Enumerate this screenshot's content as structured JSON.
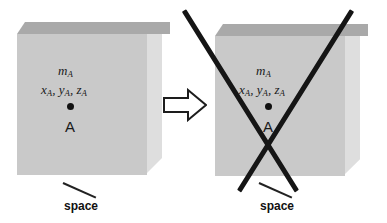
{
  "figure": {
    "background_color": "#ffffff",
    "line_color": "#151515"
  },
  "colors": {
    "slab_front": "#c9c9c9",
    "slab_top": "#a9a9a9",
    "slab_side": "#dedede",
    "ink": "#151515",
    "text": "#1a1a1a"
  },
  "panels": [
    {
      "id": "before",
      "slab": {
        "name": "space-slab",
        "caption": "space"
      },
      "labels": {
        "mass": "m",
        "mass_sub": "A",
        "coords": [
          {
            "sym": "x",
            "sub": "A"
          },
          {
            "sym": "y",
            "sub": "A"
          },
          {
            "sym": "z",
            "sub": "A"
          }
        ],
        "coords_text": "x , y , z",
        "separator": ",",
        "point": "A"
      },
      "struck_out": false
    },
    {
      "id": "after",
      "slab": {
        "name": "space-slab",
        "caption": "space"
      },
      "labels": {
        "mass": "m",
        "mass_sub": "A",
        "coords": [
          {
            "sym": "x",
            "sub": "A"
          },
          {
            "sym": "y",
            "sub": "A"
          },
          {
            "sym": "z",
            "sub": "A"
          }
        ],
        "coords_text": "x , y , z",
        "separator": ",",
        "point": "A"
      },
      "struck_out": true
    }
  ],
  "arrow": {
    "name": "transition-arrow",
    "direction": "right",
    "style": "outlined"
  }
}
